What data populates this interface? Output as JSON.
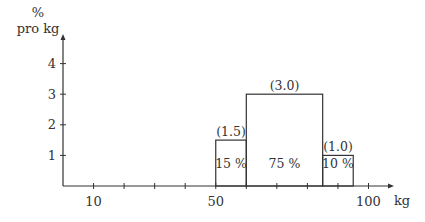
{
  "chart_data": {
    "type": "bar",
    "title": "",
    "xlabel": "kg",
    "ylabel_line1": "%",
    "ylabel_line2": "pro kg",
    "xlim": [
      0,
      105
    ],
    "ylim": [
      0,
      4.5
    ],
    "grid": false,
    "x_ticks": [
      10,
      20,
      30,
      40,
      50,
      60,
      70,
      80,
      90,
      100
    ],
    "x_tick_labels": [
      {
        "value": 10,
        "label": "10"
      },
      {
        "value": 50,
        "label": "50"
      },
      {
        "value": 100,
        "label": "100"
      }
    ],
    "y_ticks": [
      {
        "value": 1,
        "label": "1"
      },
      {
        "value": 2,
        "label": "2"
      },
      {
        "value": 3,
        "label": "3"
      },
      {
        "value": 4,
        "label": "4"
      }
    ],
    "bins": [
      {
        "from": 50,
        "to": 60,
        "density": 1.5,
        "density_label": "(1.5)",
        "percent": 15,
        "percent_label": "15 %"
      },
      {
        "from": 60,
        "to": 85,
        "density": 3.0,
        "density_label": "(3.0)",
        "percent": 75,
        "percent_label": "75 %"
      },
      {
        "from": 85,
        "to": 95,
        "density": 1.0,
        "density_label": "(1.0)",
        "percent": 10,
        "percent_label": "10 %"
      }
    ]
  },
  "colors": {
    "line": "#333333",
    "text": "#333333",
    "background": "#ffffff"
  }
}
